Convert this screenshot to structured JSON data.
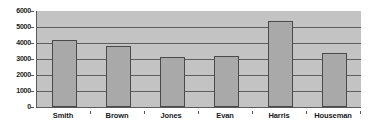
{
  "chart_data": {
    "type": "bar",
    "title": "",
    "subtitle": "",
    "xlabel": "",
    "ylabel": "",
    "categories": [
      "Smith",
      "Brown",
      "Jones",
      "Evan",
      "Harris",
      "Houseman"
    ],
    "values": [
      4190,
      3810,
      3125,
      3190,
      5375,
      3375
    ],
    "series": [
      {
        "name": "Series 1",
        "values": [
          4190,
          3810,
          3125,
          3190,
          5375,
          3375
        ]
      }
    ],
    "ylim": [
      0,
      6000
    ],
    "ytick_labels": [
      "0",
      "1000",
      "2000",
      "3000",
      "4000",
      "5000",
      "6000"
    ],
    "ytick_values": [
      0,
      1000,
      2000,
      3000,
      4000,
      5000,
      6000
    ],
    "grid": true,
    "grid_axis": "y",
    "legend": false,
    "legend_position": "none",
    "annotations": [],
    "colors": {
      "bar_fill": "#a9a9a9",
      "bar_border": "#4a4a4a",
      "plot_background": "#c3c3c3",
      "gridline": "#5e5e5e",
      "axis_line": "#5a5a5a",
      "text": "#1a1a1a",
      "figure_background": "#ffffff"
    }
  }
}
